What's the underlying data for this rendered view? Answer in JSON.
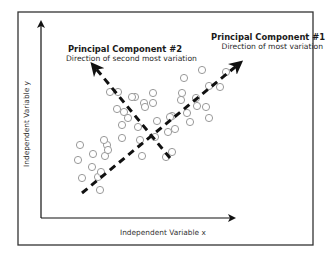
{
  "diagram": {
    "type": "PCA scatter illustration",
    "principal_components": [
      {
        "id": "pc1",
        "title": "Principal Component #1",
        "subtitle": "Direction of most variation"
      },
      {
        "id": "pc2",
        "title": "Principal Component #2",
        "subtitle": "Direction of second most variation"
      }
    ],
    "axes": {
      "x_label": "Independent Variable x",
      "y_label": "Independent Variable y"
    },
    "colors": {
      "frame": "#333333",
      "axis": "#111111",
      "arrow": "#111111",
      "point_stroke": "#9a9a9a",
      "background": "#ffffff"
    },
    "arrows": {
      "pc1": {
        "from": [
          82,
          193
        ],
        "to": [
          240,
          63
        ]
      },
      "pc2": {
        "from": [
          170,
          158
        ],
        "to": [
          93,
          65
        ]
      }
    },
    "points": [
      [
        80,
        145
      ],
      [
        93,
        154
      ],
      [
        78,
        160
      ],
      [
        92,
        167
      ],
      [
        107,
        145
      ],
      [
        105,
        156
      ],
      [
        108,
        150
      ],
      [
        98,
        177
      ],
      [
        82,
        178
      ],
      [
        100,
        190
      ],
      [
        101,
        172
      ],
      [
        110,
        92
      ],
      [
        118,
        92
      ],
      [
        135,
        97
      ],
      [
        153,
        93
      ],
      [
        117,
        109
      ],
      [
        124,
        112
      ],
      [
        144,
        103
      ],
      [
        153,
        103
      ],
      [
        132,
        97
      ],
      [
        122,
        125
      ],
      [
        138,
        127
      ],
      [
        157,
        121
      ],
      [
        172,
        116
      ],
      [
        104,
        140
      ],
      [
        122,
        138
      ],
      [
        168,
        132
      ],
      [
        155,
        137
      ],
      [
        172,
        152
      ],
      [
        142,
        156
      ],
      [
        166,
        157
      ],
      [
        145,
        107
      ],
      [
        182,
        93
      ],
      [
        170,
        117
      ],
      [
        184,
        78
      ],
      [
        202,
        70
      ],
      [
        209,
        86
      ],
      [
        220,
        87
      ],
      [
        197,
        106
      ],
      [
        206,
        107
      ],
      [
        209,
        118
      ],
      [
        187,
        113
      ],
      [
        226,
        72
      ],
      [
        181,
        100
      ],
      [
        190,
        122
      ],
      [
        128,
        118
      ],
      [
        140,
        140
      ],
      [
        196,
        98
      ],
      [
        175,
        129
      ]
    ]
  }
}
